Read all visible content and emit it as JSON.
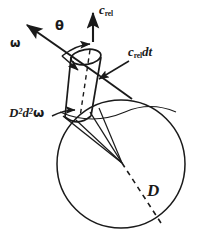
{
  "figure": {
    "name": "collision-cylinder-diagram",
    "background_color": "#ffffff",
    "stroke_color": "#1a1a1a"
  },
  "labels": {
    "relative_velocity": {
      "base": "c",
      "subscript": "rel"
    },
    "swept_length": {
      "base": "c",
      "subscript": "rel",
      "trailing": "dt"
    },
    "angular_element": {
      "symbol": "ω"
    },
    "angle": {
      "symbol": "θ"
    },
    "solid_angle_element": {
      "base1": "D",
      "exp1": "2",
      "base2": "d",
      "exp2": "2",
      "symbol": "ω"
    },
    "sphere_diameter": {
      "symbol": "D"
    }
  },
  "geometry": {
    "sphere": {
      "cx": 121,
      "cy": 164,
      "r": 64
    },
    "cylinder": {
      "top_ellipse": {
        "cx": 86,
        "cy": 57,
        "rx": 15,
        "ry": 7
      },
      "bottom_ellipse": {
        "cx": 78,
        "cy": 117,
        "rx": 13,
        "ry": 6
      },
      "axis_dashed": true
    },
    "arrows": {
      "c_rel": {
        "x": 93,
        "y1": 40,
        "y2": 12,
        "direction": "up"
      },
      "omega": {
        "x1": 100,
        "y1": 76,
        "x2": 27,
        "y2": 26,
        "direction": "up-left"
      },
      "omega_tail": {
        "x1": 100,
        "y1": 76,
        "x2": 128,
        "y2": 96
      },
      "c_rel_dt_leader": {
        "x1": 127,
        "y1": 62,
        "x2": 98,
        "y2": 79
      },
      "base_leader": {
        "x1": 55,
        "y1": 117,
        "x2": 82,
        "y2": 112
      }
    },
    "angle_arc": {
      "from": "omega-axis",
      "to": "vertical-dashed-axis"
    },
    "cone_apex": {
      "x": 122,
      "y": 163
    },
    "diameter_line": {
      "x1": 122,
      "y1": 163,
      "x2": 160,
      "y2": 222,
      "dashed": true
    }
  }
}
